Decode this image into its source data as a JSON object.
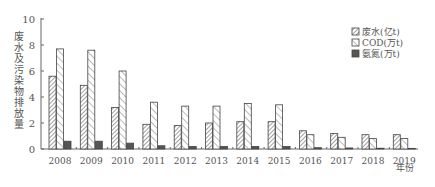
{
  "chart_data": {
    "type": "bar",
    "title": "",
    "xlabel": "年份",
    "ylabel": "废水及污染物排放量",
    "ylim": [
      0,
      10
    ],
    "yticks": [
      0,
      2,
      4,
      6,
      8,
      10
    ],
    "grid": false,
    "legend_position": "upper right",
    "categories": [
      "2008",
      "2009",
      "2010",
      "2011",
      "2012",
      "2013",
      "2014",
      "2015",
      "2016",
      "2017",
      "2018",
      "2019"
    ],
    "series": [
      {
        "name": "废水(亿t)",
        "pattern": "dense-hatch",
        "values": [
          5.6,
          4.9,
          3.2,
          1.9,
          1.8,
          2.0,
          2.1,
          2.1,
          1.4,
          1.2,
          1.1,
          1.1
        ]
      },
      {
        "name": "COD(万t)",
        "pattern": "sparse-hatch",
        "values": [
          7.7,
          7.6,
          6.0,
          3.6,
          3.3,
          3.3,
          3.5,
          3.4,
          1.1,
          0.9,
          0.8,
          0.8
        ]
      },
      {
        "name": "氨氮(万t)",
        "pattern": "solid-dark",
        "values": [
          0.6,
          0.6,
          0.45,
          0.25,
          0.2,
          0.2,
          0.2,
          0.2,
          0.1,
          0.08,
          0.06,
          0.05
        ]
      }
    ]
  },
  "colors": {
    "axis": "#666666",
    "text": "#555555",
    "solid": "#555555",
    "hatch": "#777777"
  }
}
